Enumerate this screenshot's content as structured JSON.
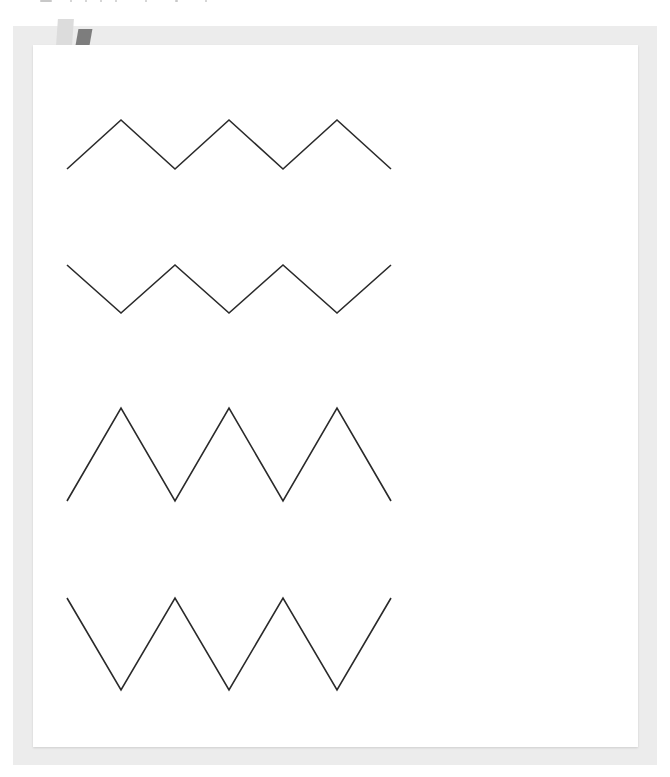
{
  "worksheet": {
    "description": "Zigzag line tracing worksheet with four rows of zigzag patterns",
    "frame_color": "#ececec",
    "paper_color": "#ffffff",
    "tape": [
      {
        "name": "light-tape",
        "color": "#dcdcdc"
      },
      {
        "name": "dark-tape",
        "color": "#7d7d7d"
      }
    ],
    "line_color": "#2a2a2a",
    "zigzags": [
      {
        "name": "zigzag-row-1",
        "shape": "shallow-peaks-up",
        "points": "67,169 121,120 175,169 229,120 283,169 337,120 391,169"
      },
      {
        "name": "zigzag-row-2",
        "shape": "shallow-valleys-down",
        "points": "67,265 121,313 175,265 229,313 283,265 337,313 391,265"
      },
      {
        "name": "zigzag-row-3",
        "shape": "tall-peaks-up",
        "points": "67,501 121,408 175,501 229,408 283,501 337,408 391,501"
      },
      {
        "name": "zigzag-row-4",
        "shape": "tall-valleys-down",
        "points": "67,598 121,690 175,598 229,690 283,598 337,690 391,598"
      }
    ]
  }
}
